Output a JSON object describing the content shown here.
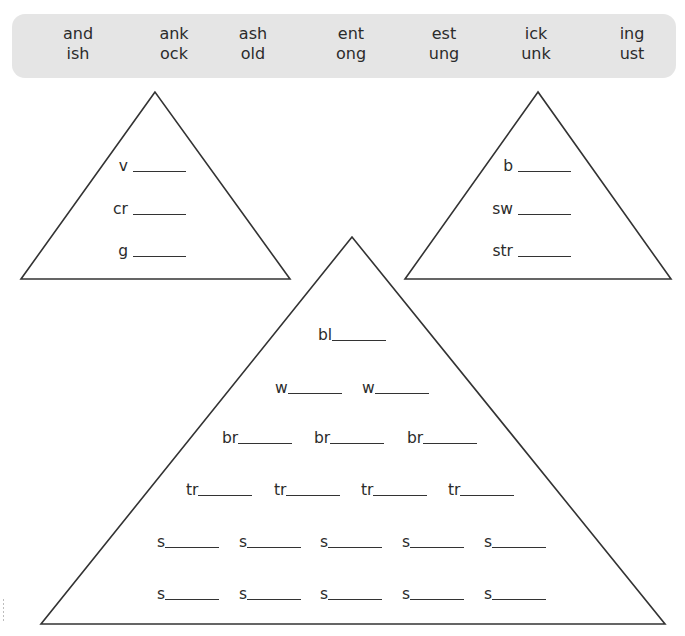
{
  "word_bank": {
    "row1": [
      "and",
      "ank",
      "ash",
      "ent",
      "est",
      "ick",
      "ing"
    ],
    "row2": [
      "ish",
      "ock",
      "old",
      "ong",
      "ung",
      "unk",
      "ust"
    ]
  },
  "triangles": {
    "left": {
      "blanks": [
        {
          "prefix": "v"
        },
        {
          "prefix": "cr"
        },
        {
          "prefix": "g"
        }
      ]
    },
    "right": {
      "blanks": [
        {
          "prefix": "b"
        },
        {
          "prefix": "sw"
        },
        {
          "prefix": "str"
        }
      ]
    },
    "big": {
      "rows": [
        [
          "bl"
        ],
        [
          "w",
          "w"
        ],
        [
          "br",
          "br",
          "br"
        ],
        [
          "tr",
          "tr",
          "tr",
          "tr"
        ],
        [
          "s",
          "s",
          "s",
          "s",
          "s"
        ],
        [
          "s",
          "s",
          "s",
          "s",
          "s"
        ]
      ]
    }
  },
  "colors": {
    "word_bank_bg": "#e5e5e5",
    "stroke": "#333333",
    "text": "#2b2b2b"
  }
}
